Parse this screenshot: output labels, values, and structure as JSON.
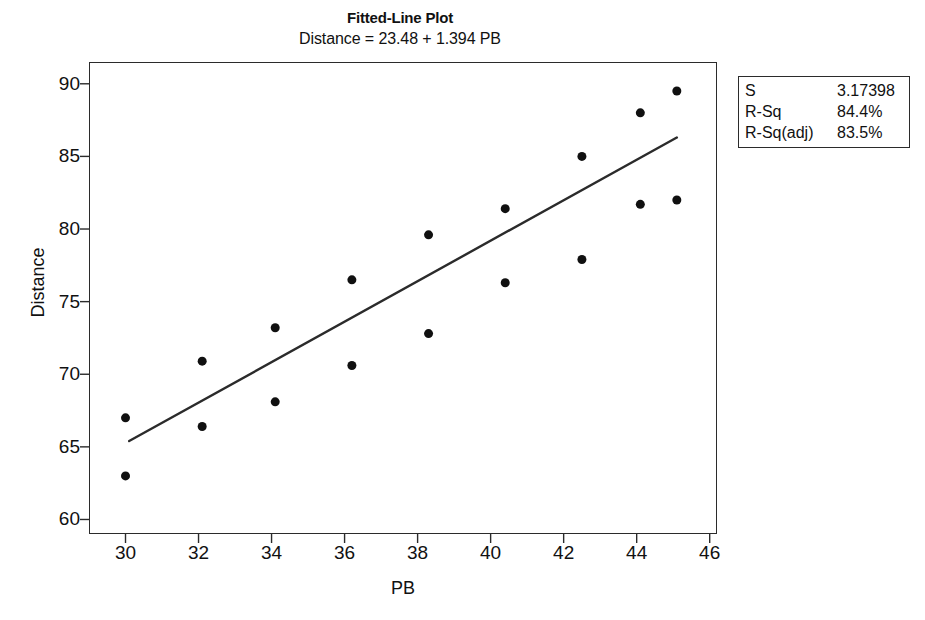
{
  "chart_data": {
    "type": "scatter",
    "title": "Fitted-Line Plot",
    "subtitle": "Distance = 23.48 + 1.394 PB",
    "xlabel": "PB",
    "ylabel": "Distance",
    "xlim": [
      29.0,
      46.2
    ],
    "ylim": [
      59.0,
      91.5
    ],
    "xticks": [
      30,
      32,
      34,
      36,
      38,
      40,
      42,
      44,
      46
    ],
    "yticks": [
      60,
      65,
      70,
      75,
      80,
      85,
      90
    ],
    "grid": false,
    "legend_position": "outside-right-top",
    "points": [
      {
        "x": 30.0,
        "y": 67.0
      },
      {
        "x": 30.0,
        "y": 63.0
      },
      {
        "x": 32.1,
        "y": 70.9
      },
      {
        "x": 32.1,
        "y": 66.4
      },
      {
        "x": 34.1,
        "y": 73.2
      },
      {
        "x": 34.1,
        "y": 68.1
      },
      {
        "x": 36.2,
        "y": 76.5
      },
      {
        "x": 36.2,
        "y": 70.6
      },
      {
        "x": 38.3,
        "y": 79.6
      },
      {
        "x": 38.3,
        "y": 72.8
      },
      {
        "x": 40.4,
        "y": 81.4
      },
      {
        "x": 40.4,
        "y": 76.3
      },
      {
        "x": 42.5,
        "y": 85.0
      },
      {
        "x": 42.5,
        "y": 77.9
      },
      {
        "x": 44.1,
        "y": 88.0
      },
      {
        "x": 44.1,
        "y": 81.7
      },
      {
        "x": 45.1,
        "y": 89.5
      },
      {
        "x": 45.1,
        "y": 82.0
      }
    ],
    "fit_line": {
      "intercept": 23.48,
      "slope": 1.394,
      "x_start": 30.1,
      "x_end": 45.1,
      "y_start": 65.4,
      "y_end": 86.3
    },
    "marker": {
      "shape": "circle",
      "color": "#101010",
      "size": 9
    },
    "line_color": "#2b2b2b",
    "stats": [
      {
        "key": "S",
        "value": "3.17398"
      },
      {
        "key": "R-Sq",
        "value": "84.4%"
      },
      {
        "key": "R-Sq(adj)",
        "value": "83.5%"
      }
    ]
  }
}
